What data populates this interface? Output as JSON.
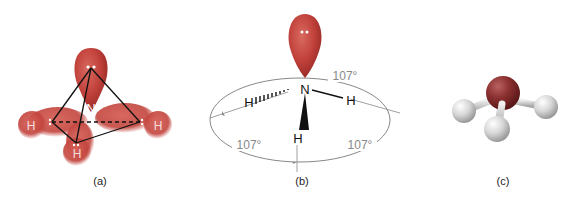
{
  "figure": {
    "panels": [
      {
        "id": "a",
        "caption": "(a)",
        "atoms": {
          "center": "N",
          "h1": "H",
          "h2": "H",
          "h3": "H"
        }
      },
      {
        "id": "b",
        "caption": "(b)",
        "atoms": {
          "center": "N",
          "h_back": "H",
          "h_right": "H",
          "h_front": "H"
        },
        "angles": [
          "107°",
          "107°",
          "107°"
        ]
      },
      {
        "id": "c",
        "caption": "(c)"
      }
    ],
    "colors": {
      "lobe": "#c0403a",
      "lobe_dark": "#8e2a26",
      "nitrogen_sphere": "#8b3030",
      "hydrogen_sphere": "#d8d8d8",
      "angle_line": "#888888",
      "bond": "#222222"
    }
  }
}
